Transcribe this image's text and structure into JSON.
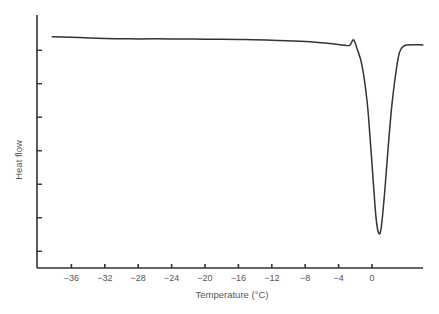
{
  "chart_data": {
    "type": "line",
    "title": "",
    "xlabel": "Temperature (°C)",
    "ylabel": "Heat flow",
    "xlim": [
      -39,
      6.2
    ],
    "ylim": [
      0,
      7.5
    ],
    "x_ticks": [
      -36,
      -32,
      -28,
      -24,
      -20,
      -16,
      -12,
      -8,
      -4,
      0
    ],
    "x_tick_labels": [
      "−36",
      "−32",
      "−28",
      "−24",
      "−20",
      "−16",
      "−12",
      "−8",
      "−4",
      "0"
    ],
    "y_ticks": [
      0.5,
      1.5,
      2.5,
      3.5,
      4.5,
      5.5,
      6.5
    ],
    "y_tick_labels": [],
    "grid": false,
    "legend": null,
    "series": [
      {
        "name": "DSC heat flow",
        "color": "#333333",
        "x": [
          -38.3,
          -35,
          -32,
          -28,
          -24,
          -20,
          -16,
          -12,
          -8,
          -5,
          -3,
          -2.6,
          -2.2,
          -1.8,
          -1.2,
          -0.6,
          -0.2,
          0.2,
          0.5,
          0.8,
          1.1,
          1.5,
          1.9,
          2.4,
          2.9,
          3.3,
          3.8,
          4.3,
          6.1
        ],
        "y": [
          6.9,
          6.88,
          6.85,
          6.84,
          6.84,
          6.83,
          6.82,
          6.8,
          6.76,
          6.7,
          6.64,
          6.67,
          6.81,
          6.55,
          6.05,
          5.0,
          3.8,
          2.4,
          1.45,
          1.04,
          1.2,
          2.2,
          3.5,
          4.9,
          5.9,
          6.45,
          6.62,
          6.66,
          6.66
        ]
      }
    ],
    "annotations": []
  },
  "axes": {
    "x_title": "Temperature (°C)",
    "y_title": "Heat flow"
  }
}
